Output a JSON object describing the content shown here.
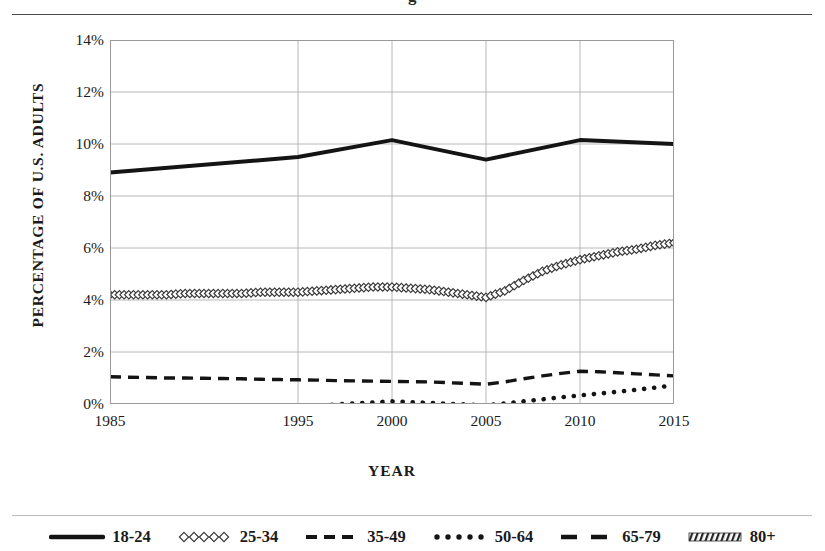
{
  "page": {
    "cropped_title_fragment": "g",
    "background": "#ffffff",
    "ink": "#1b1b1b"
  },
  "chart_data": {
    "type": "line",
    "title": "",
    "xlabel": "YEAR",
    "ylabel": "PERCENTAGE OF U.S. ADULTS",
    "x": [
      1985,
      1986,
      1987,
      1988,
      1989,
      1990,
      1991,
      1992,
      1993,
      1994,
      1995,
      1996,
      1997,
      1998,
      1999,
      2000,
      2001,
      2002,
      2003,
      2004,
      2005,
      2006,
      2007,
      2008,
      2009,
      2010,
      2011,
      2012,
      2013,
      2014,
      2015
    ],
    "xlim": [
      1985,
      2015
    ],
    "ylim": [
      0,
      14
    ],
    "y_tick_labels": [
      "0%",
      "2%",
      "4%",
      "6%",
      "8%",
      "10%",
      "12%",
      "14%"
    ],
    "y_tick_values": [
      0,
      2,
      4,
      6,
      8,
      10,
      12,
      14
    ],
    "x_tick_labels": [
      "1985",
      "1995",
      "2000",
      "2005",
      "2010",
      "2015"
    ],
    "x_tick_values": [
      1985,
      1995,
      2000,
      2005,
      2010,
      2015
    ],
    "grid": true,
    "legend_position": "bottom",
    "series": [
      {
        "name": "18-24",
        "style": "solid-thick",
        "color": "#141414",
        "vertices_x": [
          1985,
          1995,
          2000,
          2005,
          2010,
          2015
        ],
        "vertices_y": [
          8.9,
          9.5,
          10.15,
          9.4,
          10.15,
          10.0
        ]
      },
      {
        "name": "25-34",
        "style": "diamond-markers",
        "color": "#3a3a3a",
        "values": [
          4.2,
          4.2,
          4.2,
          4.2,
          4.25,
          4.25,
          4.25,
          4.25,
          4.3,
          4.3,
          4.3,
          4.35,
          4.4,
          4.45,
          4.5,
          4.5,
          4.45,
          4.4,
          4.3,
          4.2,
          4.1,
          4.35,
          4.75,
          5.1,
          5.35,
          5.55,
          5.7,
          5.85,
          5.95,
          6.1,
          6.2
        ]
      },
      {
        "name": "35-49",
        "style": "dashed",
        "color": "#141414",
        "values": [
          1.05,
          1.03,
          1.02,
          1.0,
          1.0,
          0.99,
          0.98,
          0.97,
          0.95,
          0.94,
          0.93,
          0.92,
          0.9,
          0.89,
          0.88,
          0.87,
          0.86,
          0.85,
          0.82,
          0.79,
          0.76,
          0.85,
          0.97,
          1.08,
          1.18,
          1.26,
          1.24,
          1.2,
          1.16,
          1.12,
          1.08
        ]
      },
      {
        "name": "50-64",
        "style": "dotted",
        "color": "#141414",
        "values": [
          -0.4,
          -0.37,
          -0.34,
          -0.31,
          -0.28,
          -0.25,
          -0.22,
          -0.19,
          -0.16,
          -0.13,
          -0.1,
          -0.06,
          -0.02,
          0.02,
          0.06,
          0.1,
          0.07,
          0.04,
          0.01,
          -0.02,
          -0.05,
          0.02,
          0.1,
          0.18,
          0.26,
          0.33,
          0.4,
          0.47,
          0.55,
          0.63,
          0.72
        ]
      },
      {
        "name": "65-79",
        "style": "long-dash",
        "color": "#141414",
        "values": [
          -0.72,
          -0.72,
          -0.72,
          -0.72,
          -0.72,
          -0.72,
          -0.71,
          -0.71,
          -0.71,
          -0.7,
          -0.7,
          -0.69,
          -0.68,
          -0.67,
          -0.66,
          -0.65,
          -0.64,
          -0.62,
          -0.6,
          -0.58,
          -0.56,
          -0.52,
          -0.47,
          -0.42,
          -0.37,
          -0.33,
          -0.3,
          -0.27,
          -0.24,
          -0.21,
          -0.17
        ]
      },
      {
        "name": "80+",
        "style": "hatched-band",
        "color": "#2d2d2d",
        "values": [
          -0.78,
          -0.78,
          -0.78,
          -0.78,
          -0.78,
          -0.78,
          -0.78,
          -0.78,
          -0.78,
          -0.78,
          -0.78,
          -0.78,
          -0.78,
          -0.78,
          -0.78,
          -0.78,
          -0.78,
          -0.78,
          -0.78,
          -0.78,
          -0.79,
          -0.79,
          -0.79,
          -0.79,
          -0.79,
          -0.79,
          -0.78,
          -0.78,
          -0.78,
          -0.78,
          -0.78
        ]
      }
    ]
  },
  "legend": {
    "items": [
      {
        "label": "18-24",
        "swatch": "solid-thick-swatch"
      },
      {
        "label": "25-34",
        "swatch": "diamond-swatch"
      },
      {
        "label": "35-49",
        "swatch": "dashed-swatch"
      },
      {
        "label": "50-64",
        "swatch": "dotted-swatch"
      },
      {
        "label": "65-79",
        "swatch": "long-dash-swatch"
      },
      {
        "label": "80+",
        "swatch": "hatched-swatch"
      }
    ]
  }
}
